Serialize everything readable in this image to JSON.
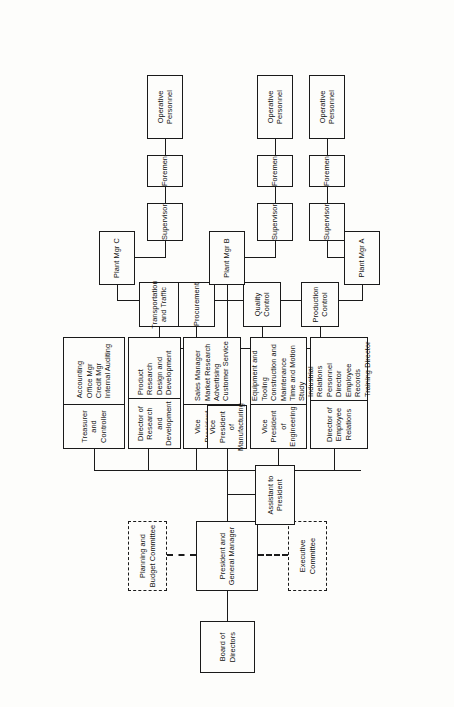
{
  "chart_title": "Company Organization Chart",
  "nodes": {
    "board": {
      "label": "Board of Directors"
    },
    "president": {
      "label": "President and\nGeneral Manager"
    },
    "planning_committee": {
      "label": "Planning and\nBudget Committee"
    },
    "executive_committee": {
      "label": "Executive\nCommittee"
    },
    "assistant": {
      "label": "Assistant to\nPresident"
    },
    "employee_relations": {
      "label": "Director of\nEmployee Relations",
      "items": "Industrial Relations\nPersonnel Director\nEmployee Records\nTraining Director"
    },
    "engineering": {
      "label": "Vice President\nof Engineering",
      "items": "Equipment and Tooling\nConstruction and Maintenance\nTime and Motion Study"
    },
    "manufacturing": {
      "label": "Vice President\nof Manufacturing"
    },
    "marketing": {
      "label": "Vice President\nof Marketing",
      "items": "Sales Manager\nMarket Research\nAdvertising\nCustomer Service"
    },
    "research": {
      "label": "Director of\nResearch and Development",
      "items": "Product Research\nDesign and Development"
    },
    "treasurer": {
      "label": "Treasurer\nand Controller",
      "items": "Accounting\nOffice Mgr\nCredit Mgr\nInternal Auditing"
    },
    "production_control": {
      "label": "Production Control"
    },
    "quality_control": {
      "label": "Quality Control"
    },
    "procurement": {
      "label": "Procurement"
    },
    "transportation": {
      "label": "Transportation\nand Traffic"
    },
    "plant_a": {
      "label": "Plant Mgr A"
    },
    "plant_b": {
      "label": "Plant Mgr B"
    },
    "plant_c": {
      "label": "Plant Mgr C"
    },
    "supervisor_b": {
      "label": "Supervisor"
    },
    "foremen_b": {
      "label": "Foremen"
    },
    "operative_b": {
      "label": "Operative Personnel"
    },
    "supervisor_c": {
      "label": "Supervisor"
    },
    "foremen_c": {
      "label": "Foremen"
    },
    "operative_c": {
      "label": "Operative Personnel"
    },
    "supervisor_d": {
      "label": "Supervisor"
    },
    "foremen_d": {
      "label": "Foremen"
    },
    "operative_d": {
      "label": "Operative Personnel"
    }
  },
  "colors": {
    "line": "#1a1a1a",
    "box_fill": "#fdfdfb",
    "page": "#fdfdfb"
  }
}
